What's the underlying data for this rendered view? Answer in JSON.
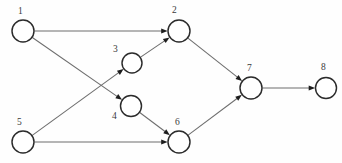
{
  "diagram": {
    "type": "directed-graph",
    "width": 342,
    "height": 163,
    "background_color": "#fefefe",
    "node_fill_color": "#ffffff",
    "node_stroke_color": "#2b2b2b",
    "edge_color": "#6d6d6d",
    "arrow_color": "#1d1d1d",
    "label_color": "#3a3a3a",
    "nodes": [
      {
        "id": "1",
        "label": "1",
        "cx": 23,
        "cy": 31,
        "r": 11,
        "label_x": 18,
        "label_y": 7
      },
      {
        "id": "2",
        "label": "2",
        "cx": 179,
        "cy": 31,
        "r": 11,
        "label_x": 172,
        "label_y": 6
      },
      {
        "id": "3",
        "label": "3",
        "cx": 132,
        "cy": 63,
        "r": 10,
        "label_x": 113,
        "label_y": 45
      },
      {
        "id": "4",
        "label": "4",
        "cx": 131,
        "cy": 106,
        "r": 10.5,
        "label_x": 112,
        "label_y": 112
      },
      {
        "id": "5",
        "label": "5",
        "cx": 23,
        "cy": 142,
        "r": 11,
        "label_x": 17,
        "label_y": 118
      },
      {
        "id": "6",
        "label": "6",
        "cx": 179,
        "cy": 142,
        "r": 11,
        "label_x": 175,
        "label_y": 118
      },
      {
        "id": "7",
        "label": "7",
        "cx": 251,
        "cy": 88,
        "r": 11,
        "label_x": 247,
        "label_y": 64
      },
      {
        "id": "8",
        "label": "8",
        "cx": 326,
        "cy": 88,
        "r": 10.5,
        "label_x": 321,
        "label_y": 63
      }
    ],
    "edges": [
      {
        "id": "e1",
        "from": "1",
        "to": "2"
      },
      {
        "id": "e2",
        "from": "1",
        "to": "4"
      },
      {
        "id": "e3",
        "from": "5",
        "to": "3"
      },
      {
        "id": "e4",
        "from": "5",
        "to": "6"
      },
      {
        "id": "e5",
        "from": "3",
        "to": "2"
      },
      {
        "id": "e6",
        "from": "4",
        "to": "6"
      },
      {
        "id": "e7",
        "from": "2",
        "to": "7"
      },
      {
        "id": "e8",
        "from": "6",
        "to": "7"
      },
      {
        "id": "e9",
        "from": "7",
        "to": "8"
      }
    ]
  }
}
